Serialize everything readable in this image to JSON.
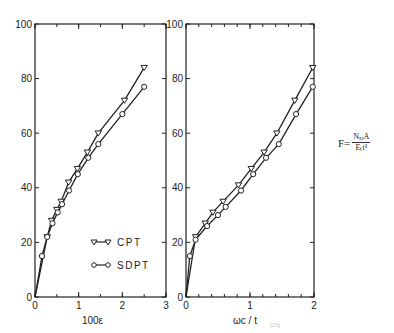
{
  "chart_data": [
    {
      "type": "line",
      "title": "",
      "xlabel": "100ε",
      "ylabel": "",
      "xlim": [
        0,
        3
      ],
      "ylim": [
        0,
        100
      ],
      "xticks": [
        "0",
        "1",
        "2",
        "3"
      ],
      "yticks": [
        "0",
        "20",
        "40",
        "60",
        "80",
        "100"
      ],
      "grid": false,
      "legend_position": "lower right",
      "series": [
        {
          "name": "CPT",
          "marker": "triangle-down",
          "x": [
            0.28,
            0.38,
            0.5,
            0.6,
            0.77,
            0.97,
            1.2,
            1.45,
            2.05,
            2.5
          ],
          "y": [
            22,
            28,
            32,
            35,
            42,
            47,
            53,
            60,
            72,
            84
          ]
        },
        {
          "name": "SDPT",
          "marker": "circle",
          "x": [
            0.16,
            0.28,
            0.4,
            0.52,
            0.62,
            0.78,
            0.98,
            1.22,
            1.45,
            2.0,
            2.5
          ],
          "y": [
            15,
            22,
            27,
            31,
            34,
            39,
            45,
            51,
            56,
            67,
            77
          ]
        }
      ]
    },
    {
      "type": "line",
      "title": "",
      "xlabel": "ωc / t",
      "ylabel": "",
      "xlim": [
        0,
        2
      ],
      "ylim": [
        0,
        100
      ],
      "xticks": [
        "0",
        "1",
        "2"
      ],
      "yticks": [
        "0",
        "20",
        "40",
        "60",
        "80",
        "100"
      ],
      "grid": false,
      "series": [
        {
          "name": "CPT",
          "marker": "triangle-down",
          "x": [
            0.15,
            0.3,
            0.42,
            0.58,
            0.82,
            1.02,
            1.22,
            1.42,
            1.7,
            1.98
          ],
          "y": [
            22,
            27,
            31,
            35,
            41,
            47,
            53,
            60,
            72,
            84
          ]
        },
        {
          "name": "SDPT",
          "marker": "circle",
          "x": [
            0.06,
            0.15,
            0.33,
            0.5,
            0.62,
            0.86,
            1.05,
            1.25,
            1.45,
            1.72,
            1.98
          ],
          "y": [
            15,
            21,
            26,
            30,
            33,
            39,
            45,
            51,
            56,
            67,
            77
          ]
        }
      ]
    }
  ],
  "legend": {
    "cpt": "CPT",
    "sdpt": "SDPT"
  },
  "formula": {
    "lhs": "F=",
    "numerator": "NₓᵧA",
    "denominator": "Eₜt³"
  },
  "caption": "(23)"
}
